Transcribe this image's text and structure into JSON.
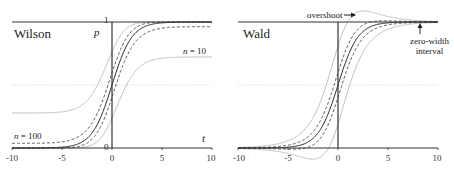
{
  "chart_data": [
    {
      "type": "line",
      "title": "Wilson",
      "xlabel": "t",
      "ylabel": "p",
      "xlim": [
        -10,
        10
      ],
      "ylim": [
        0,
        1
      ],
      "x_ticks": [
        "-10",
        "-5",
        "0",
        "5",
        "10"
      ],
      "y_ticks": [
        "0",
        "1"
      ],
      "grid": false,
      "reference_lines": [
        {
          "y": 0.5,
          "style": "dotted"
        },
        {
          "y": 1,
          "style": "solid"
        },
        {
          "y": 0,
          "style": "solid"
        }
      ],
      "function": "p = 1/(1+exp(-t))",
      "interval_method": "wilson",
      "z": 1.96,
      "annotations": [
        {
          "text": "n = 10",
          "x": 7,
          "y": 0.8
        },
        {
          "text": "n = 100",
          "x": -8.5,
          "y": 0.2
        }
      ],
      "series": [
        {
          "name": "p (estimate)",
          "style": "solid-dark",
          "n": null
        },
        {
          "name": "n = 10 upper",
          "style": "solid-light",
          "n": 10
        },
        {
          "name": "n = 10 lower",
          "style": "solid-light",
          "n": 10
        },
        {
          "name": "n = 100 upper",
          "style": "dashed",
          "n": 100
        },
        {
          "name": "n = 100 lower",
          "style": "dashed",
          "n": 100
        }
      ],
      "asymptotes": {
        "n10_lower_left": 0.28,
        "n10_upper_right": 0.72,
        "n100_lower_left": 0.04,
        "n100_upper_right": 0.96
      }
    },
    {
      "type": "line",
      "title": "Wald",
      "xlabel": "",
      "ylabel": "",
      "xlim": [
        -10,
        10
      ],
      "ylim": [
        0,
        1
      ],
      "x_ticks": [
        "-10",
        "-5",
        "0",
        "5",
        "10"
      ],
      "grid": false,
      "reference_lines": [
        {
          "y": 0.5,
          "style": "dotted"
        },
        {
          "y": 1,
          "style": "solid"
        },
        {
          "y": 0,
          "style": "solid"
        }
      ],
      "function": "p = 1/(1+exp(-t))",
      "interval_method": "wald",
      "z": 1.96,
      "annotations": [
        {
          "text": "overshoot",
          "arrow": "right",
          "x": -0.5,
          "y": 1.08
        },
        {
          "text": "zero-width interval",
          "arrow": "up",
          "x": 9,
          "y": 0.85
        }
      ],
      "series": [
        {
          "name": "p (estimate)",
          "style": "solid-dark",
          "n": null
        },
        {
          "name": "n = 10 upper",
          "style": "solid-light",
          "n": 10
        },
        {
          "name": "n = 10 lower",
          "style": "solid-light",
          "n": 10
        },
        {
          "name": "n = 100 upper",
          "style": "dashed",
          "n": 100
        },
        {
          "name": "n = 100 lower",
          "style": "dashed",
          "n": 100
        }
      ]
    }
  ],
  "left": {
    "title": "Wilson",
    "ylabel": "p",
    "xlabel": "t",
    "y_top": "1",
    "y_bottom": "0",
    "n10_label": "n = 10",
    "n100_label": "n = 100",
    "ticks": [
      "-10",
      "-5",
      "0",
      "5",
      "10"
    ]
  },
  "right": {
    "title": "Wald",
    "overshoot_label": "overshoot",
    "zero_width_label_1": "zero-width",
    "zero_width_label_2": "interval",
    "ticks": [
      "-10",
      "-5",
      "0",
      "5",
      "10"
    ]
  },
  "colors": {
    "axis": "#333333",
    "estimate": "#222222",
    "n10": "#b8b8b8",
    "n100": "#444444",
    "refline": "#c8c8c8"
  }
}
